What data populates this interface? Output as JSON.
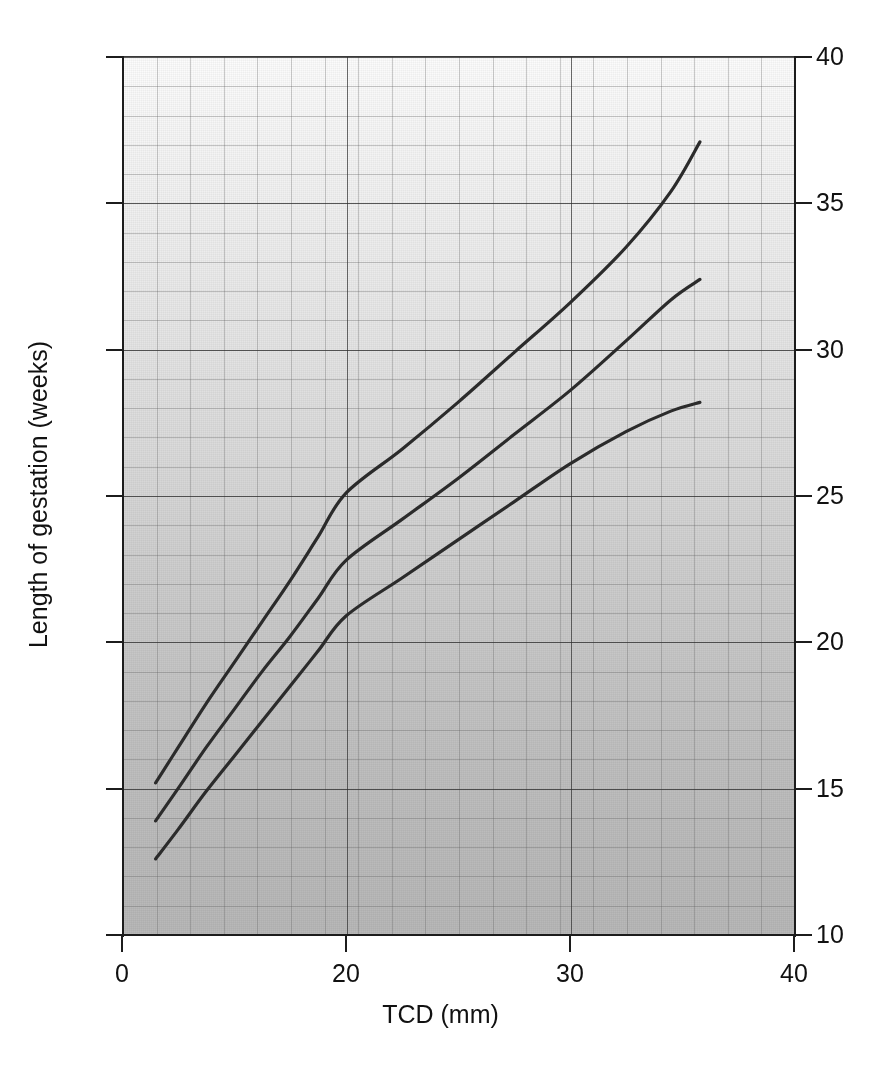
{
  "figure": {
    "kind": "scanned-nomogram",
    "background_color": "#ffffff",
    "plot_fill_top": "#fcfcfc",
    "plot_fill_bottom": "#b8b8b8",
    "grid_minor_color": "#5a5a5a",
    "grid_major_color": "#2d2d2d",
    "axis_color": "#1c1c1c",
    "curve_color": "#2b2b2b"
  },
  "chart_data": {
    "type": "line",
    "title": "",
    "subtitle": "",
    "xlabel": "TCD (mm)",
    "ylabel": "Length of gestation (weeks)",
    "xlim": [
      0,
      40
    ],
    "ylim": [
      10,
      40
    ],
    "grid": true,
    "grid_minor_x_step": 2,
    "grid_minor_y_step": 1,
    "grid_major_x_step": 10,
    "grid_major_y_step": 5,
    "legend": "none",
    "x_tick_labels": [
      "0",
      "20",
      "30",
      "40"
    ],
    "x_tick_values": [
      0,
      20,
      30,
      40
    ],
    "x_tick_positions_px": [
      122,
      346,
      570,
      794
    ],
    "y_tick_labels": [
      "40",
      "35",
      "30",
      "25",
      "20",
      "15",
      "10"
    ],
    "y_tick_values": [
      40,
      35,
      30,
      25,
      20,
      15,
      10
    ],
    "y_axis_mirrored": true,
    "y_tick_labels_right": [
      "40",
      "35",
      "30",
      "25",
      "20",
      "15",
      "10"
    ],
    "series": [
      {
        "name": "upper-percentile",
        "role": "95th centile",
        "x": [
          3.0,
          5.0,
          7.5,
          10.0,
          12.5,
          15.0,
          17.5,
          20.0,
          22.5,
          25.0,
          27.5,
          30.0,
          32.5,
          34.5,
          35.8
        ],
        "y": [
          15.2,
          16.4,
          17.9,
          19.3,
          20.7,
          22.1,
          23.6,
          25.1,
          26.6,
          28.2,
          29.9,
          31.6,
          33.5,
          35.4,
          37.1
        ]
      },
      {
        "name": "median",
        "role": "50th centile",
        "x": [
          3.0,
          5.0,
          7.5,
          10.0,
          12.5,
          15.0,
          17.5,
          20.0,
          22.5,
          25.0,
          27.5,
          30.0,
          32.5,
          34.5,
          35.8
        ],
        "y": [
          13.9,
          15.0,
          16.4,
          17.7,
          19.0,
          20.2,
          21.5,
          22.8,
          24.2,
          25.6,
          27.1,
          28.6,
          30.3,
          31.7,
          32.4
        ]
      },
      {
        "name": "lower-percentile",
        "role": "5th centile",
        "x": [
          3.0,
          5.0,
          7.5,
          10.0,
          12.5,
          15.0,
          17.5,
          20.0,
          22.5,
          25.0,
          27.5,
          30.0,
          32.5,
          34.5,
          35.8
        ],
        "y": [
          12.6,
          13.6,
          14.9,
          16.1,
          17.3,
          18.5,
          19.7,
          20.9,
          22.2,
          23.5,
          24.8,
          26.1,
          27.2,
          27.9,
          28.2
        ]
      }
    ]
  }
}
